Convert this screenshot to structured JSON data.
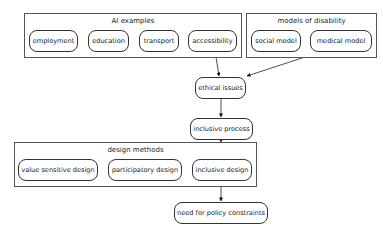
{
  "clusters": {
    "ai_examples": {
      "label": "AI examples",
      "nodes": [
        "employment",
        "education",
        "transport",
        "accessibility"
      ]
    },
    "models_of_disability": {
      "label": "models of disability",
      "nodes": [
        "social model",
        "medical model"
      ]
    },
    "design_methods": {
      "label": "design methods",
      "nodes": [
        "value sensitive design",
        "participatory design",
        "inclusive design"
      ]
    }
  },
  "nodes": {
    "ethical_issues": "ethical issues",
    "inclusive_process": "inclusive process",
    "need_for_policy": "need for policy constraints"
  },
  "edges": [
    {
      "from": "AI examples",
      "to": "ethical issues"
    },
    {
      "from": "models of disability",
      "to": "ethical issues"
    },
    {
      "from": "ethical issues",
      "to": "inclusive process"
    },
    {
      "from": "inclusive process",
      "to": "design methods"
    },
    {
      "from": "design methods",
      "to": "need for policy constraints"
    }
  ]
}
